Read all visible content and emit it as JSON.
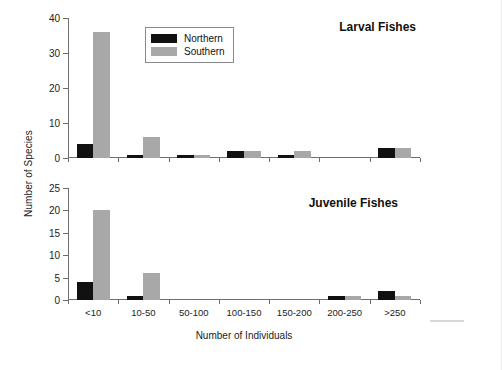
{
  "chart_data": {
    "type": "bar",
    "title": "",
    "xlabel": "Number of Individuals",
    "ylabel": "Number of Species",
    "categories": [
      "<10",
      "10-50",
      "50-100",
      "100-150",
      "150-200",
      "200-250",
      ">250"
    ],
    "legend": {
      "position": "top-center",
      "entries": [
        {
          "name": "Northern",
          "color": "#111111"
        },
        {
          "name": "Southern",
          "color": "#a8a8a8"
        }
      ]
    },
    "panels": [
      {
        "title": "Larval Fishes",
        "ylim": [
          0,
          40
        ],
        "yticks": [
          0,
          10,
          20,
          30,
          40
        ],
        "grid": false,
        "series": [
          {
            "name": "Northern",
            "values": [
              4,
              1,
              1,
              2,
              1,
              0,
              3
            ]
          },
          {
            "name": "Southern",
            "values": [
              36,
              6,
              1,
              2,
              2,
              0,
              3
            ]
          }
        ]
      },
      {
        "title": "Juvenile Fishes",
        "ylim": [
          0,
          25
        ],
        "yticks": [
          0,
          5,
          10,
          15,
          20,
          25
        ],
        "grid": false,
        "series": [
          {
            "name": "Northern",
            "values": [
              4,
              1,
              0,
              0,
              0,
              1,
              2
            ]
          },
          {
            "name": "Southern",
            "values": [
              20,
              6,
              0,
              0,
              0,
              1,
              1
            ]
          }
        ]
      }
    ]
  }
}
